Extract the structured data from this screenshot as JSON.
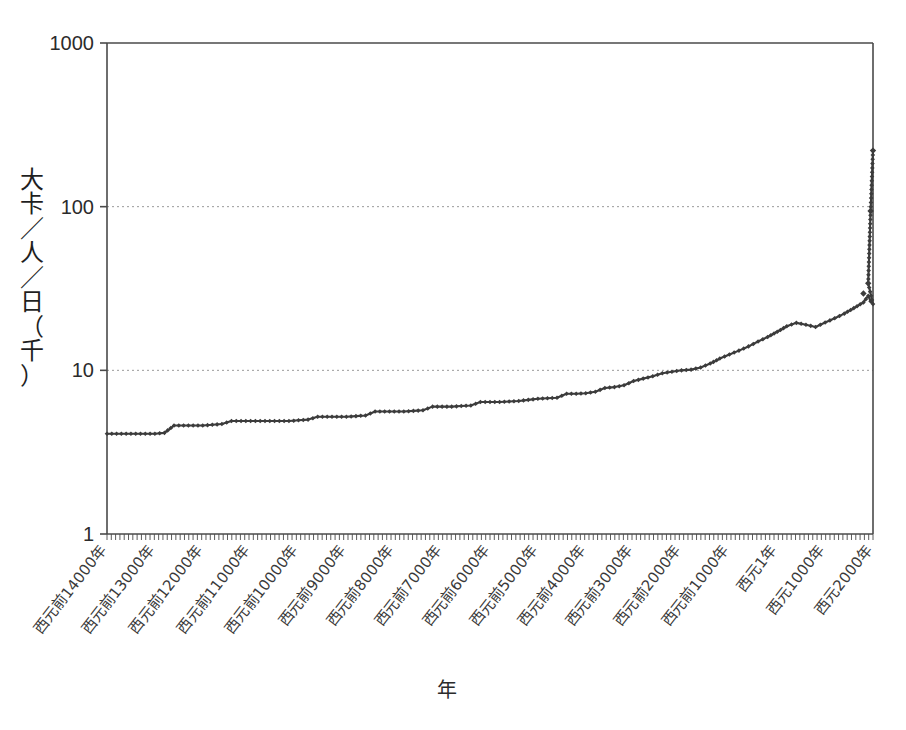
{
  "chart_data": {
    "type": "line",
    "title": "",
    "xlabel": "年",
    "ylabel": "大卡／人／日（千）",
    "yscale": "log",
    "ylim": [
      1,
      1000
    ],
    "ytick_labels": [
      "1000",
      "100",
      "10",
      "1"
    ],
    "ytick_values": [
      1000,
      100,
      10,
      1
    ],
    "grid": "horizontal-dotted",
    "legend": "none",
    "marker": "diamond",
    "line_color": "#3c3c3c",
    "xtick_labels": [
      "西元前14000年",
      "西元前13000年",
      "西元前12000年",
      "西元前11000年",
      "西元前10000年",
      "西元前9000年",
      "西元前8000年",
      "西元前7000年",
      "西元前6000年",
      "西元前5000年",
      "西元前4000年",
      "西元前3000年",
      "西元前2000年",
      "西元前1000年",
      "西元1年",
      "西元1000年",
      "西元2000年"
    ],
    "xtick_values": [
      -14000,
      -13000,
      -12000,
      -11000,
      -10000,
      -9000,
      -8000,
      -7000,
      -6000,
      -5000,
      -4000,
      -3000,
      -2000,
      -1000,
      1,
      1000,
      2000
    ],
    "x": [
      -14000,
      -13800,
      -13600,
      -13400,
      -13200,
      -13000,
      -12800,
      -12600,
      -12400,
      -12200,
      -12000,
      -11800,
      -11600,
      -11400,
      -11200,
      -11000,
      -10800,
      -10600,
      -10400,
      -10200,
      -10000,
      -9800,
      -9600,
      -9400,
      -9200,
      -9000,
      -8800,
      -8600,
      -8400,
      -8200,
      -8000,
      -7800,
      -7600,
      -7400,
      -7200,
      -7000,
      -6800,
      -6600,
      -6400,
      -6200,
      -6000,
      -5800,
      -5600,
      -5400,
      -5200,
      -5000,
      -4800,
      -4600,
      -4400,
      -4200,
      -4000,
      -3800,
      -3600,
      -3400,
      -3200,
      -3000,
      -2800,
      -2600,
      -2400,
      -2200,
      -2000,
      -1800,
      -1600,
      -1400,
      -1200,
      -1000,
      -800,
      -600,
      -400,
      -200,
      1,
      200,
      400,
      600,
      800,
      1000,
      1200,
      1400,
      1600,
      1800,
      1900,
      1950,
      2000
    ],
    "y": [
      4.1,
      4.1,
      4.1,
      4.1,
      4.1,
      4.1,
      4.15,
      4.6,
      4.6,
      4.6,
      4.6,
      4.65,
      4.7,
      4.9,
      4.9,
      4.9,
      4.9,
      4.9,
      4.9,
      4.9,
      4.95,
      5.0,
      5.2,
      5.2,
      5.2,
      5.2,
      5.25,
      5.3,
      5.6,
      5.6,
      5.6,
      5.6,
      5.65,
      5.7,
      6.0,
      6.0,
      6.0,
      6.05,
      6.1,
      6.4,
      6.4,
      6.4,
      6.45,
      6.5,
      6.6,
      6.7,
      6.75,
      6.8,
      7.2,
      7.2,
      7.25,
      7.4,
      7.8,
      7.9,
      8.1,
      8.6,
      8.9,
      9.2,
      9.6,
      9.8,
      10.0,
      10.1,
      10.4,
      11.0,
      11.8,
      12.5,
      13.2,
      14.0,
      15.0,
      16.0,
      17.2,
      18.6,
      19.5,
      19.0,
      18.4,
      19.6,
      20.8,
      22.2,
      24.0,
      26.0,
      28.5,
      26.4,
      25.4
    ],
    "y_detail_points": [
      {
        "label": "earliest value",
        "value": 4.1
      },
      {
        "label": "pre-industrial peak",
        "value": 28.5
      },
      {
        "label": "1900-level",
        "value": 34
      },
      {
        "label": "1950-level",
        "value": 94
      },
      {
        "label": "2000-level",
        "value": 220
      }
    ],
    "tail_x": [
      1800,
      1900,
      1950,
      2000
    ],
    "tail_y": [
      29.5,
      34,
      94,
      220
    ]
  },
  "axes": {
    "x_title": "年",
    "y_title_chars": "大卡／人／日（千）"
  }
}
